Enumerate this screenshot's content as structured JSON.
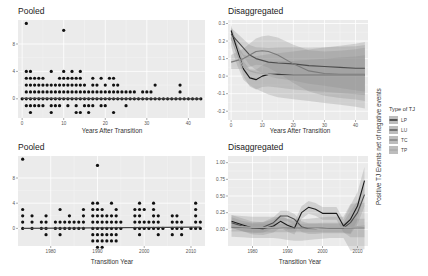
{
  "figure": {
    "y_axis_shared_label": "Positive TJ Events net of negative events",
    "legend": {
      "title": "Type of TJ",
      "items": [
        {
          "label": "LP",
          "color": "#1a1a1a"
        },
        {
          "label": "LU",
          "color": "#4d4d4d"
        },
        {
          "label": "TC",
          "color": "#7a7a7a"
        },
        {
          "label": "TP",
          "color": "#a8a8a8"
        }
      ]
    }
  },
  "panels": {
    "top_left": {
      "title": "Pooled",
      "xlabel": "Years After Transition"
    },
    "top_right": {
      "title": "Disaggregated",
      "xlabel": "Years After Transition"
    },
    "bottom_left": {
      "title": "Pooled",
      "xlabel": "Transition Year"
    },
    "bottom_right": {
      "title": "Disaggregated",
      "xlabel": "Transition Year"
    }
  },
  "chart_data": [
    {
      "type": "scatter",
      "title": "Pooled",
      "xlabel": "Years After Transition",
      "ylabel": "",
      "xlim": [
        -1,
        44
      ],
      "ylim": [
        -2.8,
        11.5
      ],
      "xticks": [
        0,
        10,
        20,
        30,
        40
      ],
      "yticks": [
        0,
        4,
        8
      ],
      "grid": true,
      "points_by_y": {
        "11": [
          1
        ],
        "10": [
          10
        ],
        "4": [
          1,
          2,
          7,
          10,
          12,
          14
        ],
        "3": [
          1,
          2,
          3,
          4,
          5,
          9,
          10,
          11,
          12,
          13,
          14,
          17,
          19,
          21,
          22
        ],
        "2": [
          1,
          2,
          3,
          4,
          5,
          6,
          7,
          8,
          9,
          10,
          11,
          12,
          13,
          14,
          15,
          17,
          18,
          20,
          22,
          23,
          32,
          38
        ],
        "1": [
          1,
          2,
          3,
          4,
          5,
          6,
          7,
          8,
          9,
          10,
          11,
          12,
          13,
          14,
          15,
          16,
          17,
          18,
          19,
          20,
          21,
          22,
          23,
          24,
          25,
          26,
          27,
          29,
          30,
          31,
          38
        ],
        "0": [
          0,
          1,
          2,
          3,
          4,
          5,
          6,
          7,
          8,
          9,
          10,
          11,
          12,
          13,
          14,
          15,
          16,
          17,
          18,
          19,
          20,
          21,
          22,
          23,
          24,
          25,
          26,
          27,
          28,
          29,
          30,
          31,
          32,
          33,
          34,
          35,
          36,
          37,
          38,
          39,
          40,
          41,
          42,
          43
        ],
        "-1": [
          1,
          2,
          3,
          4,
          5,
          7,
          8,
          9,
          11,
          13,
          15,
          16,
          17,
          19,
          20,
          25
        ],
        "-2": [
          2,
          7,
          13,
          14,
          16,
          22
        ]
      },
      "fit_line": {
        "x": [
          0,
          43
        ],
        "y": [
          0.05,
          0.0
        ]
      }
    },
    {
      "type": "line",
      "title": "Disaggregated",
      "xlabel": "Years After Transition",
      "ylabel": "Positive TJ Events net of negative events",
      "xlim": [
        -1,
        44
      ],
      "ylim": [
        -0.25,
        0.32
      ],
      "xticks": [
        0,
        10,
        20,
        30,
        40
      ],
      "yticks": [
        -0.2,
        -0.1,
        0.0,
        0.1,
        0.2,
        0.3
      ],
      "grid": true,
      "x": [
        0,
        2,
        4,
        6,
        8,
        10,
        12,
        15,
        20,
        25,
        30,
        35,
        40,
        43
      ],
      "series": [
        {
          "name": "LP",
          "values": [
            0.26,
            0.15,
            0.04,
            -0.01,
            -0.02,
            0.0,
            0.01,
            0.01,
            0.005,
            0.005,
            0.005,
            0.005,
            0.005,
            0.005
          ],
          "band": 0.03
        },
        {
          "name": "LU",
          "values": [
            0.24,
            0.2,
            0.16,
            0.12,
            0.1,
            0.09,
            0.08,
            0.075,
            0.07,
            0.06,
            0.055,
            0.05,
            0.045,
            0.045
          ],
          "band": 0.035
        },
        {
          "name": "TC",
          "values": [
            0.08,
            0.09,
            0.1,
            0.12,
            0.14,
            0.145,
            0.14,
            0.12,
            0.07,
            0.03,
            0.015,
            0.01,
            0.01,
            0.01
          ],
          "band": 0.04
        },
        {
          "name": "TP",
          "values": [
            0.22,
            0.12,
            0.05,
            0.03,
            0.02,
            0.015,
            0.01,
            0.005,
            0.005,
            0.005,
            0.005,
            0.005,
            0.005,
            0.005
          ],
          "band": 0.05
        }
      ]
    },
    {
      "type": "scatter",
      "title": "Pooled",
      "xlabel": "Transition Year",
      "ylabel": "",
      "xlim": [
        1973,
        2013
      ],
      "ylim": [
        -2.8,
        11.5
      ],
      "xticks": [
        1980,
        1990,
        2000,
        2010
      ],
      "yticks": [
        0,
        4,
        8
      ],
      "grid": true,
      "points_by_y": {
        "11": [
          1974
        ],
        "10": [
          1990
        ],
        "4": [
          1989,
          1990,
          1993,
          1999,
          2002,
          2011
        ],
        "3": [
          1974,
          1982,
          1987,
          1989,
          1990,
          1991,
          1994,
          1998,
          1999,
          2000,
          2002,
          2011
        ],
        "2": [
          1974,
          1976,
          1979,
          1984,
          1987,
          1989,
          1990,
          1991,
          1992,
          1993,
          1994,
          1998,
          1999,
          2002,
          2003,
          2006,
          2007,
          2011
        ],
        "1": [
          1974,
          1976,
          1978,
          1979,
          1981,
          1982,
          1983,
          1984,
          1985,
          1986,
          1987,
          1989,
          1990,
          1991,
          1992,
          1993,
          1994,
          1995,
          1998,
          1999,
          2000,
          2001,
          2002,
          2003,
          2006,
          2007,
          2008,
          2011,
          2012
        ],
        "0": [
          1974,
          1976,
          1978,
          1979,
          1981,
          1982,
          1983,
          1984,
          1985,
          1986,
          1987,
          1989,
          1990,
          1991,
          1992,
          1993,
          1994,
          1995,
          1998,
          1999,
          2000,
          2001,
          2002,
          2003,
          2004,
          2006,
          2007,
          2008,
          2010,
          2011,
          2012
        ],
        "-1": [
          1979,
          1982,
          1989,
          1990,
          1991,
          1992,
          1993,
          1994,
          1999,
          2003,
          2006,
          2008
        ],
        "-2": [
          1989,
          1990,
          1991,
          1992,
          1993,
          1994
        ],
        "-3": [
          1990,
          1991
        ]
      },
      "fit_line": {
        "x": [
          1974,
          2012
        ],
        "y": [
          0.0,
          0.2
        ]
      }
    },
    {
      "type": "line",
      "title": "Disaggregated",
      "xlabel": "Transition Year",
      "ylabel": "Positive TJ Events net of negative events",
      "xlim": [
        1973,
        2013
      ],
      "ylim": [
        -0.25,
        1.1
      ],
      "xticks": [
        1980,
        1990,
        2000,
        2010
      ],
      "yticks": [
        0.0,
        0.25,
        0.5,
        0.75,
        1.0
      ],
      "grid": true,
      "x": [
        1974,
        1977,
        1980,
        1983,
        1986,
        1988,
        1990,
        1992,
        1994,
        1996,
        1998,
        2000,
        2002,
        2004,
        2006,
        2008,
        2010,
        2012
      ],
      "series": [
        {
          "name": "LP",
          "values": [
            0.12,
            0.07,
            0.02,
            0.01,
            0.05,
            0.12,
            0.06,
            0.02,
            0.25,
            0.33,
            0.3,
            0.24,
            0.24,
            0.24,
            0.05,
            0.15,
            0.35,
            0.73
          ],
          "band": 0.06
        },
        {
          "name": "LU",
          "values": [
            0.1,
            0.05,
            0.02,
            0.03,
            0.1,
            0.2,
            0.2,
            0.15,
            0.04,
            0.01,
            0.01,
            0.02,
            0.02,
            0.02,
            0.02,
            0.1,
            0.25,
            0.52
          ],
          "band": 0.05
        },
        {
          "name": "TC",
          "values": [
            0.03,
            0.03,
            0.02,
            0.02,
            0.02,
            0.02,
            0.02,
            0.02,
            0.02,
            0.02,
            0.02,
            0.02,
            0.02,
            0.02,
            0.02,
            0.02,
            0.02,
            0.02
          ],
          "band": 0.04
        },
        {
          "name": "TP",
          "values": [
            0.05,
            0.04,
            0.03,
            0.03,
            0.03,
            0.02,
            0.0,
            -0.01,
            -0.01,
            0.0,
            0.01,
            0.02,
            0.03,
            0.03,
            0.03,
            0.03,
            0.04,
            0.05
          ],
          "band": 0.1
        }
      ]
    }
  ]
}
